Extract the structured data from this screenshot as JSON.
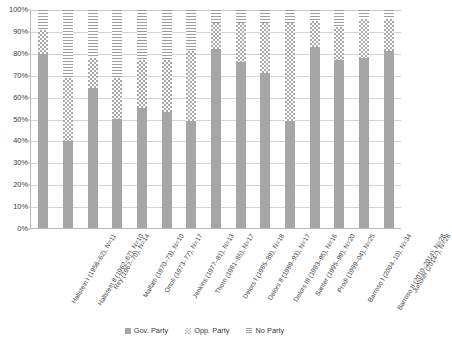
{
  "chart_data": {
    "type": "bar",
    "stacked": true,
    "stacked_mode": "percent",
    "title": "",
    "subtitle": "",
    "xlabel": "",
    "ylabel": "",
    "ylim": [
      0,
      100
    ],
    "ytick_labels": [
      "100%",
      "90%",
      "80%",
      "70%",
      "60%",
      "50%",
      "40%",
      "30%",
      "20%",
      "10%",
      "0%"
    ],
    "ytick_values": [
      100,
      90,
      80,
      70,
      60,
      50,
      40,
      30,
      20,
      10,
      0
    ],
    "grid": true,
    "grid_axis": "y",
    "legend_position": "bottom",
    "legend": [
      "Gov. Party",
      "Opp. Party",
      "No Party"
    ],
    "categories": [
      "Hallstein I (1958–62), N=11",
      "Hallstein II (1962–67), N=10",
      "Rey (1967–70), N=14",
      "Malfatti (1970–73), N=10",
      "Ortoli (1973–77), N=17",
      "Jenkins (1977–81), N=13",
      "Thorn (1981–85), N=17",
      "Delors I (1985–89), N=18",
      "Delors II (1989–93), N=17",
      "Delors III (1993–95), N=16",
      "Santer (1995–99), N=20",
      "Prodi (1999–04), N=25",
      "Barroso I (2004–10), N=34",
      "Barroso II (2010–2014), N=28",
      "Juncker (2014–), N=28"
    ],
    "series": [
      {
        "name": "Gov. Party",
        "color": "#a6a6a6",
        "pattern": "solid",
        "values": [
          80,
          40,
          64,
          50,
          55,
          53,
          49,
          82,
          76,
          71,
          49,
          83,
          77,
          78,
          81
        ]
      },
      {
        "name": "Opp. Party",
        "color": "#a8a8a8",
        "pattern": "checkerboard",
        "values": [
          11,
          29,
          14,
          19,
          22,
          24,
          32,
          12,
          18,
          23,
          45,
          12,
          15,
          18,
          15
        ]
      },
      {
        "name": "No Party",
        "color": "#9e9e9e",
        "pattern": "horizontal-stripes",
        "values": [
          9,
          31,
          22,
          31,
          23,
          23,
          19,
          6,
          6,
          6,
          6,
          5,
          8,
          4,
          4
        ]
      }
    ]
  }
}
